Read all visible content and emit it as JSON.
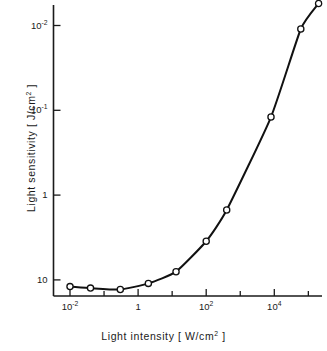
{
  "chart_data": {
    "type": "line",
    "title": "",
    "subtitle": "",
    "xlabel": "Light  intensity  [ W/cm² ]",
    "ylabel": "Light  sensitivity  [ J/cm² ]",
    "xscale": "log",
    "yscale": "log",
    "y_inverted": true,
    "xlim": [
      0.004,
      600000
    ],
    "ylim": [
      0.006,
      18
    ],
    "grid": false,
    "legend": null,
    "marker": "open-circle",
    "x_ticks": [
      {
        "value": 0.01,
        "label": "10",
        "exponent": "-2",
        "major": true
      },
      {
        "value": 0.1,
        "label": "",
        "exponent": "",
        "major": false
      },
      {
        "value": 1,
        "label": "1",
        "exponent": "",
        "major": true
      },
      {
        "value": 10,
        "label": "",
        "exponent": "",
        "major": false
      },
      {
        "value": 100,
        "label": "10",
        "exponent": "2",
        "major": true
      },
      {
        "value": 1000,
        "label": "",
        "exponent": "",
        "major": false
      },
      {
        "value": 10000,
        "label": "10",
        "exponent": "4",
        "major": true
      },
      {
        "value": 100000,
        "label": "",
        "exponent": "",
        "major": false
      }
    ],
    "y_ticks": [
      {
        "value": 0.01,
        "label": "10",
        "exponent": "-2",
        "major": true
      },
      {
        "value": 0.1,
        "label": "10",
        "exponent": "-1",
        "major": true
      },
      {
        "value": 1,
        "label": "1",
        "exponent": "",
        "major": true
      },
      {
        "value": 10,
        "label": "10",
        "exponent": "",
        "major": true
      }
    ],
    "series": [
      {
        "name": "light sensitivity vs intensity",
        "x": [
          0.01,
          0.04,
          0.3,
          2.0,
          13.0,
          100.0,
          400.0,
          8000.0,
          60000.0,
          200000.0
        ],
        "y": [
          12.0,
          12.5,
          13.0,
          11.0,
          8.0,
          3.5,
          1.5,
          0.12,
          0.011,
          0.0055
        ]
      }
    ],
    "annotations": []
  },
  "axes": {
    "x_title": "Light  intensity  [ W/cm",
    "x_title_sup": "2",
    "x_title_tail": " ]",
    "y_title": "Light  sensitivity  [ J/cm",
    "y_title_sup": "2",
    "y_title_tail": " ]"
  },
  "colors": {
    "axis": "#1a1a1a",
    "curve": "#111111",
    "marker_fill": "#ffffff",
    "marker_stroke": "#111111",
    "background": "#ffffff",
    "text": "#1a1a1a"
  }
}
